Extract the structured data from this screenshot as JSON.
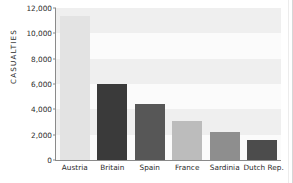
{
  "chart_data": {
    "type": "bar",
    "title": "",
    "subtitle": "",
    "xlabel": "",
    "ylabel": "CASUALTIES",
    "categories": [
      "Austria",
      "Britain",
      "Spain",
      "France",
      "Sardinia",
      "Dutch Rep."
    ],
    "values": [
      11400,
      6000,
      4400,
      3050,
      2250,
      1550
    ],
    "series": [
      {
        "name": "Casualties",
        "values": [
          11400,
          6000,
          4400,
          3050,
          2250,
          1550
        ]
      }
    ],
    "bar_colors": [
      "#e3e3e3",
      "#3a3a3a",
      "#575757",
      "#bcbcbc",
      "#8e8e8e",
      "#4c4c4c"
    ],
    "ylim": [
      0,
      12000
    ],
    "y_tick_step": 2000,
    "y_ticks": [
      0,
      2000,
      4000,
      6000,
      8000,
      10000,
      12000
    ],
    "y_tick_labels": [
      "0",
      "2,000",
      "4,000",
      "6,000",
      "8,000",
      "10,000",
      "12,000"
    ],
    "grid": true,
    "grid_style": "alternating-horizontal-bands",
    "legend": false,
    "legend_position": "none",
    "plot_background": "#fbfbfb",
    "band_color": "#efefef",
    "axis_color": "#8a8a8a",
    "text_color": "#2b2b2b"
  }
}
